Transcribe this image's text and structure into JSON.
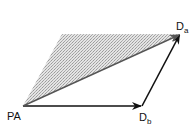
{
  "diagram": {
    "type": "vector-parallelogram",
    "points": {
      "PA": {
        "label": "PA",
        "x": 23,
        "y": 106
      },
      "Db": {
        "label_main": "D",
        "label_sub": "b",
        "x": 142,
        "y": 106
      },
      "Da": {
        "label_main": "D",
        "label_sub": "a",
        "x": 180,
        "y": 34
      },
      "shade_corner": {
        "x": 62,
        "y": 34
      }
    },
    "vectors": [
      {
        "from": "PA",
        "to": "Db",
        "color": "#111111"
      },
      {
        "from": "Db",
        "to": "Da",
        "color": "#111111"
      },
      {
        "from": "PA",
        "to": "Da",
        "color": "#555555"
      }
    ],
    "shaded_region": {
      "vertices": [
        "PA",
        "shade_corner",
        "Da"
      ],
      "fill": "#cfcfcf",
      "pattern": "stipple"
    }
  },
  "labels": {
    "pa": "PA",
    "db_main": "D",
    "db_sub": "b",
    "da_main": "D",
    "da_sub": "a"
  }
}
